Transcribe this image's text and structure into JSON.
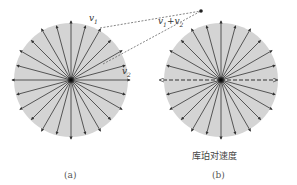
{
  "figure": {
    "panel_a": {
      "caption": "(a)",
      "labels": {
        "v1": "v",
        "v1_sub": "1",
        "v2": "v",
        "v2_sub": "2",
        "sum": "v",
        "sum_sub1": "1",
        "sum_plus": "+v",
        "sum_sub2": "2"
      },
      "arrow_count": 24
    },
    "panel_b": {
      "caption": "(b)",
      "subtitle": "库珀对速度",
      "arrow_count": 24
    },
    "colors": {
      "disk": "#d4d4d4",
      "arrow": "#333333",
      "center": "#111111",
      "dashed": "#555555"
    }
  }
}
